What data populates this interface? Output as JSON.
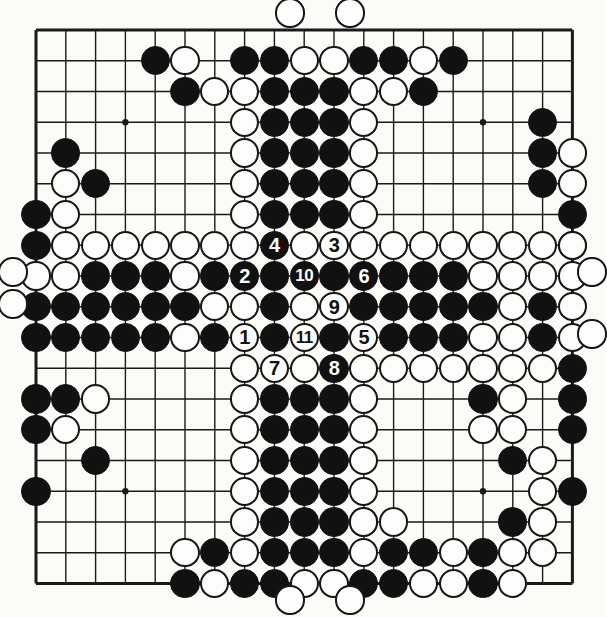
{
  "diagram": {
    "board_size": 19,
    "colors": {
      "black_stone": "#111111",
      "white_stone": "#fdfdfb",
      "line": "#1a1a1a",
      "background": "#fbfbf8"
    },
    "geometry": {
      "origin_x": 36,
      "origin_y": 30,
      "step_x": 29.8,
      "step_y": 30.75,
      "stone_radius": 14.6
    },
    "star_points": [
      [
        3,
        3
      ],
      [
        9,
        3
      ],
      [
        15,
        3
      ],
      [
        3,
        9
      ],
      [
        9,
        9
      ],
      [
        15,
        9
      ],
      [
        3,
        15
      ],
      [
        9,
        15
      ],
      [
        15,
        15
      ]
    ]
  },
  "moves": [
    {
      "n": "1",
      "color": "white",
      "col": 7,
      "row": 10
    },
    {
      "n": "2",
      "color": "black",
      "col": 7,
      "row": 8
    },
    {
      "n": "3",
      "color": "white",
      "col": 10,
      "row": 7
    },
    {
      "n": "4",
      "color": "black",
      "col": 8,
      "row": 7
    },
    {
      "n": "5",
      "color": "white",
      "col": 11,
      "row": 10
    },
    {
      "n": "6",
      "color": "black",
      "col": 11,
      "row": 8
    },
    {
      "n": "7",
      "color": "white",
      "col": 8,
      "row": 11
    },
    {
      "n": "8",
      "color": "black",
      "col": 10,
      "row": 11
    },
    {
      "n": "9",
      "color": "white",
      "col": 10,
      "row": 9
    },
    {
      "n": "10",
      "color": "black",
      "col": 9,
      "row": 8
    },
    {
      "n": "11",
      "color": "white",
      "col": 9,
      "row": 10
    }
  ],
  "black_stones": [
    [
      4,
      1
    ],
    [
      7,
      1
    ],
    [
      8,
      1
    ],
    [
      11,
      1
    ],
    [
      12,
      1
    ],
    [
      14,
      1
    ],
    [
      5,
      2
    ],
    [
      8,
      2
    ],
    [
      9,
      2
    ],
    [
      10,
      2
    ],
    [
      13,
      2
    ],
    [
      8,
      3
    ],
    [
      9,
      3
    ],
    [
      10,
      3
    ],
    [
      17,
      3
    ],
    [
      1,
      4
    ],
    [
      8,
      4
    ],
    [
      9,
      4
    ],
    [
      10,
      4
    ],
    [
      17,
      4
    ],
    [
      2,
      5
    ],
    [
      8,
      5
    ],
    [
      9,
      5
    ],
    [
      10,
      5
    ],
    [
      17,
      5
    ],
    [
      0,
      6
    ],
    [
      8,
      6
    ],
    [
      9,
      6
    ],
    [
      10,
      6
    ],
    [
      18,
      6
    ],
    [
      0,
      7
    ],
    [
      18,
      7
    ],
    [
      2,
      8
    ],
    [
      3,
      8
    ],
    [
      4,
      8
    ],
    [
      6,
      8
    ],
    [
      8,
      8
    ],
    [
      10,
      8
    ],
    [
      12,
      8
    ],
    [
      13,
      8
    ],
    [
      14,
      8
    ],
    [
      0,
      9
    ],
    [
      1,
      9
    ],
    [
      2,
      9
    ],
    [
      3,
      9
    ],
    [
      4,
      9
    ],
    [
      5,
      9
    ],
    [
      8,
      9
    ],
    [
      11,
      9
    ],
    [
      12,
      9
    ],
    [
      13,
      9
    ],
    [
      14,
      9
    ],
    [
      15,
      9
    ],
    [
      17,
      9
    ],
    [
      0,
      10
    ],
    [
      1,
      10
    ],
    [
      2,
      10
    ],
    [
      3,
      10
    ],
    [
      4,
      10
    ],
    [
      6,
      10
    ],
    [
      8,
      10
    ],
    [
      10,
      10
    ],
    [
      12,
      10
    ],
    [
      13,
      10
    ],
    [
      14,
      10
    ],
    [
      17,
      10
    ],
    [
      18,
      11
    ],
    [
      0,
      12
    ],
    [
      1,
      12
    ],
    [
      8,
      12
    ],
    [
      9,
      12
    ],
    [
      10,
      12
    ],
    [
      15,
      12
    ],
    [
      18,
      12
    ],
    [
      0,
      13
    ],
    [
      8,
      13
    ],
    [
      9,
      13
    ],
    [
      10,
      13
    ],
    [
      18,
      13
    ],
    [
      2,
      14
    ],
    [
      8,
      14
    ],
    [
      9,
      14
    ],
    [
      10,
      14
    ],
    [
      16,
      14
    ],
    [
      0,
      15
    ],
    [
      8,
      15
    ],
    [
      9,
      15
    ],
    [
      10,
      15
    ],
    [
      18,
      15
    ],
    [
      8,
      16
    ],
    [
      9,
      16
    ],
    [
      10,
      16
    ],
    [
      11,
      16
    ],
    [
      16,
      16
    ],
    [
      6,
      17
    ],
    [
      8,
      17
    ],
    [
      9,
      17
    ],
    [
      10,
      17
    ],
    [
      12,
      17
    ],
    [
      13,
      17
    ],
    [
      15,
      17
    ],
    [
      5,
      18
    ],
    [
      7,
      18
    ],
    [
      8,
      18
    ],
    [
      11,
      18
    ],
    [
      12,
      18
    ],
    [
      15,
      18
    ]
  ],
  "white_stones": [
    [
      5,
      1
    ],
    [
      9,
      1
    ],
    [
      10,
      1
    ],
    [
      13,
      1
    ],
    [
      6,
      2
    ],
    [
      7,
      2
    ],
    [
      11,
      2
    ],
    [
      12,
      2
    ],
    [
      7,
      3
    ],
    [
      11,
      3
    ],
    [
      7,
      4
    ],
    [
      11,
      4
    ],
    [
      18,
      4
    ],
    [
      1,
      5
    ],
    [
      7,
      5
    ],
    [
      11,
      5
    ],
    [
      18,
      5
    ],
    [
      1,
      6
    ],
    [
      7,
      6
    ],
    [
      11,
      6
    ],
    [
      1,
      7
    ],
    [
      2,
      7
    ],
    [
      3,
      7
    ],
    [
      4,
      7
    ],
    [
      5,
      7
    ],
    [
      6,
      7
    ],
    [
      7,
      7
    ],
    [
      9,
      7
    ],
    [
      11,
      7
    ],
    [
      12,
      7
    ],
    [
      13,
      7
    ],
    [
      14,
      7
    ],
    [
      15,
      7
    ],
    [
      16,
      7
    ],
    [
      17,
      7
    ],
    [
      18,
      7
    ],
    [
      0,
      8
    ],
    [
      1,
      8
    ],
    [
      5,
      8
    ],
    [
      7,
      8
    ],
    [
      9,
      8
    ],
    [
      11,
      8
    ],
    [
      15,
      8
    ],
    [
      16,
      8
    ],
    [
      17,
      8
    ],
    [
      18,
      8
    ],
    [
      6,
      9
    ],
    [
      7,
      9
    ],
    [
      9,
      9
    ],
    [
      16,
      9
    ],
    [
      18,
      9
    ],
    [
      5,
      10
    ],
    [
      7,
      10
    ],
    [
      9,
      10
    ],
    [
      11,
      10
    ],
    [
      15,
      10
    ],
    [
      16,
      10
    ],
    [
      18,
      10
    ],
    [
      7,
      11
    ],
    [
      8,
      11
    ],
    [
      9,
      11
    ],
    [
      11,
      11
    ],
    [
      12,
      11
    ],
    [
      13,
      11
    ],
    [
      14,
      11
    ],
    [
      15,
      11
    ],
    [
      16,
      11
    ],
    [
      17,
      11
    ],
    [
      2,
      12
    ],
    [
      7,
      12
    ],
    [
      11,
      12
    ],
    [
      16,
      12
    ],
    [
      1,
      13
    ],
    [
      7,
      13
    ],
    [
      11,
      13
    ],
    [
      15,
      13
    ],
    [
      16,
      13
    ],
    [
      7,
      14
    ],
    [
      11,
      14
    ],
    [
      17,
      14
    ],
    [
      7,
      15
    ],
    [
      11,
      15
    ],
    [
      17,
      15
    ],
    [
      7,
      16
    ],
    [
      11,
      16
    ],
    [
      12,
      16
    ],
    [
      17,
      16
    ],
    [
      5,
      17
    ],
    [
      7,
      17
    ],
    [
      11,
      17
    ],
    [
      14,
      17
    ],
    [
      16,
      17
    ],
    [
      17,
      17
    ],
    [
      6,
      18
    ],
    [
      9,
      18
    ],
    [
      10,
      18
    ],
    [
      13,
      18
    ],
    [
      14,
      18
    ],
    [
      16,
      18
    ]
  ],
  "off_board_stones": [
    {
      "color": "white",
      "x": 290,
      "y": 13
    },
    {
      "color": "white",
      "x": 350,
      "y": 13
    },
    {
      "color": "white",
      "x": 290,
      "y": 600
    },
    {
      "color": "white",
      "x": 350,
      "y": 600
    },
    {
      "color": "white",
      "x": 13,
      "y": 272
    },
    {
      "color": "white",
      "x": 13,
      "y": 304
    },
    {
      "color": "white",
      "x": 592,
      "y": 272
    },
    {
      "color": "white",
      "x": 592,
      "y": 334
    }
  ]
}
